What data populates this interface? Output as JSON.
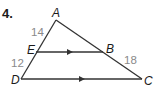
{
  "problem": {
    "number": "4."
  },
  "diagram": {
    "vertices": {
      "A": {
        "label": "A",
        "x": 56,
        "y": 20
      },
      "B": {
        "label": "B",
        "x": 103,
        "y": 52
      },
      "C": {
        "label": "C",
        "x": 142,
        "y": 79
      },
      "D": {
        "label": "D",
        "x": 21,
        "y": 79
      },
      "E": {
        "label": "E",
        "x": 36,
        "y": 52
      }
    },
    "segments": [
      {
        "from": "A",
        "to": "D"
      },
      {
        "from": "A",
        "to": "C"
      },
      {
        "from": "E",
        "to": "B",
        "parallel_marker": true
      },
      {
        "from": "D",
        "to": "C",
        "parallel_marker": true
      }
    ],
    "lengths": {
      "AE": "14",
      "ED": "12",
      "BC": "18"
    },
    "colors": {
      "line": "#333333",
      "length_text": "#8a8a8a",
      "label_text": "#1a1a1a"
    }
  }
}
